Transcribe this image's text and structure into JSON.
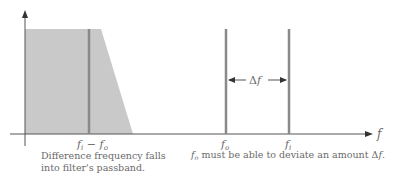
{
  "diagram": {
    "axis": {
      "x_label": "f"
    },
    "filter_passband": {
      "fill_color": "#c9c9c9"
    },
    "lines": [
      {
        "name": "difference-frequency",
        "label_main": "f",
        "label_sub1": "i",
        "label_mid": " − ",
        "label_main2": "f",
        "label_sub2": "o",
        "color": "#8a8a8a"
      },
      {
        "name": "f-o",
        "label_main": "f",
        "label_sub": "o",
        "color": "#8a8a8a"
      },
      {
        "name": "f-i",
        "label_main": "f",
        "label_sub": "i",
        "color": "#8a8a8a"
      }
    ],
    "delta": {
      "symbol": "Δ",
      "var": "f"
    },
    "captions": {
      "left_line1": "Difference frequency falls",
      "left_line2": "into filter's passband.",
      "right_main": "f",
      "right_sub": "o",
      "right_text": " must be able to deviate an amount Δ",
      "right_var": "f",
      "right_end": "."
    }
  }
}
